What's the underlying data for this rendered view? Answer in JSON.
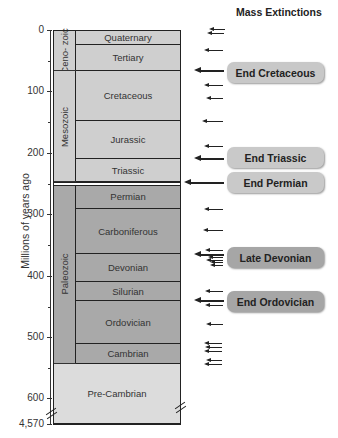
{
  "header": {
    "title": "Mass Extinctions"
  },
  "axis": {
    "label": "Millions of years ago",
    "ticks": [
      {
        "label": "0",
        "y": 30
      },
      {
        "label": "100",
        "y": 91
      },
      {
        "label": "200",
        "y": 153
      },
      {
        "label": "300",
        "y": 214
      },
      {
        "label": "400",
        "y": 276
      },
      {
        "label": "500",
        "y": 337
      },
      {
        "label": "600",
        "y": 398
      },
      {
        "label": "4,570",
        "y": 424
      }
    ]
  },
  "eras": [
    {
      "name": "Ceno-\nzoic",
      "label": "Ceno- zoic",
      "top": 30,
      "bottom": 71,
      "color": "#cfcfcf"
    },
    {
      "name": "Mesozoic",
      "label": "Mesozoic",
      "top": 71,
      "bottom": 182,
      "color": "#cfcfcf"
    },
    {
      "name": "Paleozoic",
      "label": "Paleozoic",
      "top": 184,
      "bottom": 364,
      "color": "#a9a9a9"
    }
  ],
  "periods": [
    {
      "label": "Quaternary",
      "top": 30,
      "bottom": 45,
      "color": "#cfcfcf"
    },
    {
      "label": "Tertiary",
      "top": 45,
      "bottom": 71,
      "color": "#cfcfcf"
    },
    {
      "label": "Cretaceous",
      "top": 71,
      "bottom": 121,
      "color": "#cfcfcf"
    },
    {
      "label": "Jurassic",
      "top": 121,
      "bottom": 159,
      "color": "#cfcfcf"
    },
    {
      "label": "Triassic",
      "top": 159,
      "bottom": 182,
      "color": "#cfcfcf"
    },
    {
      "label": "Permian",
      "top": 184,
      "bottom": 209,
      "color": "#a9a9a9"
    },
    {
      "label": "Carboniferous",
      "top": 209,
      "bottom": 254,
      "color": "#a9a9a9"
    },
    {
      "label": "Devonian",
      "top": 254,
      "bottom": 282,
      "color": "#a9a9a9"
    },
    {
      "label": "Silurian",
      "top": 282,
      "bottom": 301,
      "color": "#a9a9a9"
    },
    {
      "label": "Ordovician",
      "top": 301,
      "bottom": 344,
      "color": "#a9a9a9"
    },
    {
      "label": "Cambrian",
      "top": 344,
      "bottom": 364,
      "color": "#a9a9a9"
    }
  ],
  "precambrian": {
    "label": "Pre-Cambrian",
    "top": 364,
    "bottom": 424,
    "color": "#dcdcdc"
  },
  "extinctions": [
    {
      "label": "End Cretaceous",
      "y": 72,
      "color": "#c8c8c8"
    },
    {
      "label": "End Triassic",
      "y": 157,
      "color": "#c9c9c9"
    },
    {
      "label": "End Permian",
      "y": 182,
      "color": "#c9c9c9"
    },
    {
      "label": "Late Devonian",
      "y": 257,
      "color": "#a6a6a6"
    },
    {
      "label": "End Ordovician",
      "y": 301,
      "color": "#a6a6a6"
    }
  ],
  "arrows": [
    {
      "y": 29,
      "x": 213,
      "w": 12,
      "big": false
    },
    {
      "y": 33,
      "x": 211,
      "w": 13,
      "big": false
    },
    {
      "y": 50,
      "x": 208,
      "w": 15,
      "big": false
    },
    {
      "y": 70,
      "x": 200,
      "w": 24,
      "big": true
    },
    {
      "y": 85,
      "x": 208,
      "w": 15,
      "big": false
    },
    {
      "y": 98,
      "x": 210,
      "w": 13,
      "big": false
    },
    {
      "y": 121,
      "x": 206,
      "w": 17,
      "big": false
    },
    {
      "y": 146,
      "x": 208,
      "w": 15,
      "big": false
    },
    {
      "y": 158,
      "x": 200,
      "w": 24,
      "big": true
    },
    {
      "y": 182,
      "x": 190,
      "w": 34,
      "big": true
    },
    {
      "y": 209,
      "x": 208,
      "w": 15,
      "big": false
    },
    {
      "y": 230,
      "x": 207,
      "w": 16,
      "big": false
    },
    {
      "y": 250,
      "x": 209,
      "w": 14,
      "big": false
    },
    {
      "y": 254,
      "x": 200,
      "w": 24,
      "big": true
    },
    {
      "y": 257,
      "x": 212,
      "w": 11,
      "big": false
    },
    {
      "y": 260,
      "x": 210,
      "w": 13,
      "big": false
    },
    {
      "y": 262,
      "x": 214,
      "w": 9,
      "big": false
    },
    {
      "y": 265,
      "x": 214,
      "w": 9,
      "big": false
    },
    {
      "y": 291,
      "x": 209,
      "w": 14,
      "big": false
    },
    {
      "y": 300,
      "x": 200,
      "w": 24,
      "big": true
    },
    {
      "y": 305,
      "x": 209,
      "w": 14,
      "big": false
    },
    {
      "y": 324,
      "x": 210,
      "w": 13,
      "big": false
    },
    {
      "y": 343,
      "x": 208,
      "w": 14,
      "big": false
    },
    {
      "y": 347,
      "x": 209,
      "w": 13,
      "big": false
    },
    {
      "y": 351,
      "x": 208,
      "w": 14,
      "big": false
    },
    {
      "y": 360,
      "x": 210,
      "w": 12,
      "big": false
    },
    {
      "y": 364,
      "x": 208,
      "w": 14,
      "big": false
    }
  ]
}
